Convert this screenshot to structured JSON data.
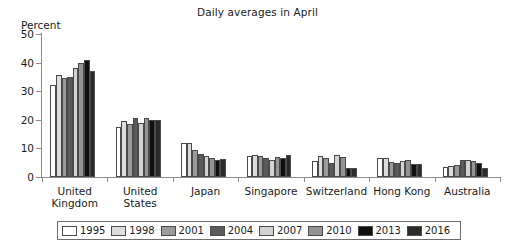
{
  "chart_data": {
    "type": "bar",
    "title": "Daily averages in April",
    "xlabel": "",
    "ylabel": "Percent",
    "ylim": [
      0,
      50
    ],
    "yticks": [
      0,
      10,
      20,
      30,
      40,
      50
    ],
    "grid": false,
    "legend_position": "bottom",
    "categories": [
      "United\nKingdom",
      "United\nStates",
      "Japan",
      "Singapore",
      "Switzerland",
      "Hong Kong",
      "Australia"
    ],
    "series": [
      {
        "name": "1995",
        "color": "#ffffff",
        "values": [
          32.0,
          17.5,
          11.8,
          7.5,
          5.5,
          6.8,
          3.5
        ]
      },
      {
        "name": "1998",
        "color": "#dcdcdc",
        "values": [
          35.5,
          19.5,
          12.0,
          7.8,
          7.4,
          6.6,
          4.0
        ]
      },
      {
        "name": "2001",
        "color": "#9a9a9a",
        "values": [
          34.5,
          18.5,
          9.5,
          7.4,
          6.5,
          5.2,
          4.3
        ]
      },
      {
        "name": "2004",
        "color": "#5a5a5a",
        "values": [
          35.0,
          20.8,
          8.0,
          6.6,
          4.8,
          5.0,
          5.8
        ]
      },
      {
        "name": "2007",
        "color": "#d2d2d2",
        "values": [
          38.0,
          19.0,
          7.5,
          6.0,
          7.8,
          5.6,
          6.0
        ]
      },
      {
        "name": "2010",
        "color": "#949494",
        "values": [
          40.0,
          20.8,
          6.8,
          7.0,
          7.0,
          6.0,
          5.5
        ]
      },
      {
        "name": "2013",
        "color": "#101010",
        "values": [
          41.0,
          19.8,
          5.8,
          6.5,
          3.2,
          4.6,
          4.8
        ]
      },
      {
        "name": "2016",
        "color": "#2b2b2b",
        "values": [
          37.2,
          20.0,
          6.2,
          7.8,
          3.0,
          4.4,
          3.3
        ]
      }
    ]
  }
}
